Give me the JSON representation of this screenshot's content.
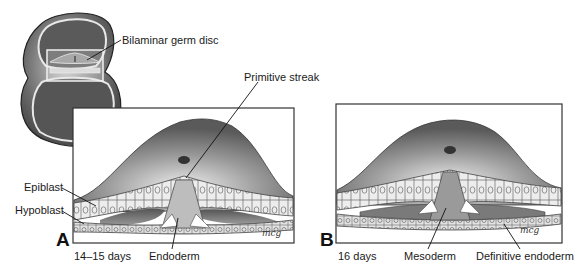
{
  "figure": {
    "overview": {
      "label": "Bilaminar germ disc"
    },
    "panel_a": {
      "letter": "A",
      "age": "14–15 days",
      "labels": {
        "primitive_streak": "Primitive streak",
        "epiblast": "Epiblast",
        "hypoblast": "Hypoblast",
        "endoderm": "Endoderm"
      },
      "signature": "mcg"
    },
    "panel_b": {
      "letter": "B",
      "age": "16 days",
      "labels": {
        "mesoderm": "Mesoderm",
        "definitive_endoderm": "Definitive endoderm"
      },
      "signature": "mcg"
    },
    "colors": {
      "frame": "#333333",
      "dark_gray": "#4a4a4a",
      "mid_gray": "#8a8a8a",
      "light_gray": "#d4d4d4",
      "cell_fill": "#ececec",
      "background": "#ffffff"
    }
  }
}
